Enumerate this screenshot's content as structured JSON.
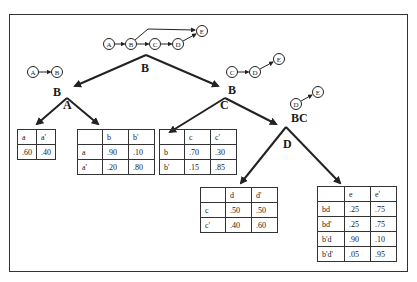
{
  "graphs": {
    "top": {
      "nodes": [
        "A",
        "B",
        "C",
        "D",
        "E"
      ]
    },
    "left": {
      "nodes": [
        "A",
        "B"
      ]
    },
    "mid": {
      "nodes": [
        "C",
        "D",
        "E"
      ]
    },
    "right": {
      "nodes": [
        "D",
        "E"
      ]
    }
  },
  "labels": {
    "root_edge": "B",
    "left_node": "B",
    "left_edge": "A",
    "right_node": "B",
    "right_edge": "C",
    "bc_node": "BC",
    "bc_edge": "D"
  },
  "tables": {
    "a": {
      "header": [
        "a",
        "a'"
      ],
      "rows": [
        [
          ".60",
          ".40"
        ]
      ]
    },
    "b": {
      "header": [
        "",
        "b",
        "b'"
      ],
      "rows": [
        [
          "a",
          ".90",
          ".10"
        ],
        [
          "a'",
          ".20",
          ".80"
        ]
      ]
    },
    "c": {
      "header": [
        "",
        "c",
        "c'"
      ],
      "rows": [
        [
          "b",
          ".70",
          ".30"
        ],
        [
          "b'",
          ".15",
          ".85"
        ]
      ]
    },
    "d": {
      "header": [
        "",
        "d",
        "d'"
      ],
      "rows": [
        [
          "c",
          ".50",
          ".50"
        ],
        [
          "c'",
          ".40",
          ".60"
        ]
      ]
    },
    "e": {
      "header": [
        "",
        "e",
        "e'"
      ],
      "rows": [
        [
          "bd",
          ".25",
          ".75"
        ],
        [
          "bd'",
          ".25",
          ".75"
        ],
        [
          "b'd",
          ".90",
          ".10"
        ],
        [
          "b'd'",
          ".05",
          ".95"
        ]
      ]
    }
  }
}
